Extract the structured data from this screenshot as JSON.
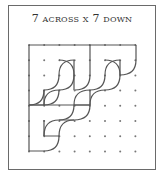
{
  "title": "7 across x 7 down",
  "grid": {
    "across": 7,
    "down": 7,
    "origin_x": 29,
    "origin_y": 45,
    "spacing": 15.2,
    "dot_color": "#777777",
    "line_color": "#555555"
  }
}
